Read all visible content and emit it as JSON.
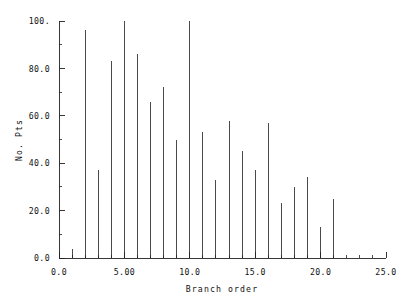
{
  "chart_data": {
    "type": "bar",
    "title": "",
    "xlabel": "Branch order",
    "ylabel": "No. Pts",
    "xlim": [
      0,
      25
    ],
    "ylim": [
      0,
      100
    ],
    "grid": false,
    "legend": null,
    "x_tick_labels": [
      "0.0",
      "5.00",
      "10.0",
      "15.0",
      "20.0",
      "25.0"
    ],
    "x_tick_values": [
      0,
      5,
      10,
      15,
      20,
      25
    ],
    "y_tick_labels": [
      "0.0",
      "20.0",
      "40.0",
      "60.0",
      "80.0",
      "100."
    ],
    "y_tick_values": [
      0,
      20,
      40,
      60,
      80,
      100
    ],
    "x_minor_interval": 1,
    "y_minor_interval": 10,
    "categories": [
      1,
      2,
      3,
      4,
      5,
      6,
      7,
      8,
      9,
      10,
      11,
      12,
      13,
      14,
      15,
      16,
      17,
      18,
      19,
      20,
      21
    ],
    "values": [
      4,
      96,
      37,
      83,
      100,
      86,
      66,
      72,
      50,
      100,
      53,
      33,
      58,
      45,
      37,
      57,
      23,
      30,
      34,
      13,
      25
    ],
    "bar_color": "#4a4a4a",
    "axis_color": "#222222"
  }
}
